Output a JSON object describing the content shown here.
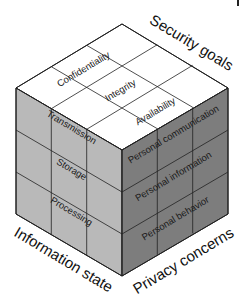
{
  "diagram": {
    "type": "3d-cube-matrix",
    "colors": {
      "top_face": "#ffffff",
      "left_face": "#b9b9b9",
      "right_face": "#7d7d7d",
      "lines": "#222222"
    },
    "axes": {
      "top": {
        "title": "Security goals",
        "items": [
          "Confidentiality",
          "Integrity",
          "Availability"
        ]
      },
      "left": {
        "title": "Information state",
        "items": [
          "Transmission",
          "Storage",
          "Processing"
        ]
      },
      "right": {
        "title": "Privacy concerns",
        "items": [
          "Personal communication",
          "Personal information",
          "Personal behavior"
        ]
      }
    }
  }
}
